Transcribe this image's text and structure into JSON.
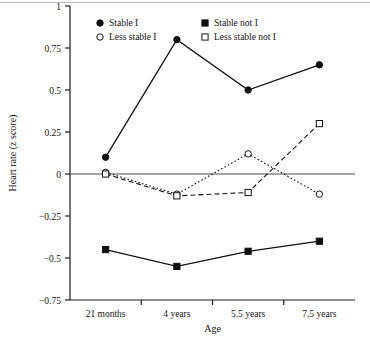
{
  "figure": {
    "background_color": "#ffffff",
    "axis_color": "#1a1a1a",
    "top_rule_color": "#b9b9b9"
  },
  "axes": {
    "y_title": "Heart rate (z score)",
    "x_title": "Age",
    "y_ticks": [
      "1",
      "0.75",
      "0.5",
      "0.25",
      "0",
      "−0.25",
      "−0.5",
      "−0.75"
    ],
    "y_tick_values": [
      1,
      0.75,
      0.5,
      0.25,
      0,
      -0.25,
      -0.5,
      -0.75
    ],
    "x_ticks": [
      "21 months",
      "4 years",
      "5.5 years",
      "7.5 years"
    ]
  },
  "legend": {
    "position": "top-inside",
    "items": [
      {
        "label": "Stable I",
        "marker": "filled-circle",
        "line": "solid"
      },
      {
        "label": "Stable not I",
        "marker": "filled-square",
        "line": "solid"
      },
      {
        "label": "Less stable I",
        "marker": "open-circle",
        "line": "dotted"
      },
      {
        "label": "Less stable not I",
        "marker": "open-square",
        "line": "dashed"
      }
    ]
  },
  "chart_data": {
    "type": "line",
    "title": "",
    "xlabel": "Age",
    "ylabel": "Heart rate (z score)",
    "categories": [
      "21 months",
      "4 years",
      "5.5 years",
      "7.5 years"
    ],
    "ylim": [
      -0.75,
      1
    ],
    "yticks": [
      -0.75,
      -0.5,
      -0.25,
      0,
      0.25,
      0.5,
      0.75,
      1
    ],
    "grid": false,
    "zero_line": true,
    "legend_position": "top-inside",
    "series": [
      {
        "name": "Stable I",
        "marker": "filled-circle",
        "line": "solid",
        "values": [
          0.1,
          0.8,
          0.5,
          0.65
        ]
      },
      {
        "name": "Stable not I",
        "marker": "filled-square",
        "line": "solid",
        "values": [
          -0.45,
          -0.55,
          -0.46,
          -0.4
        ]
      },
      {
        "name": "Less stable I",
        "marker": "open-circle",
        "line": "dotted",
        "values": [
          0.01,
          -0.12,
          0.12,
          -0.12
        ]
      },
      {
        "name": "Less stable not I",
        "marker": "open-square",
        "line": "dashed",
        "values": [
          0.0,
          -0.13,
          -0.11,
          0.3
        ]
      }
    ]
  }
}
